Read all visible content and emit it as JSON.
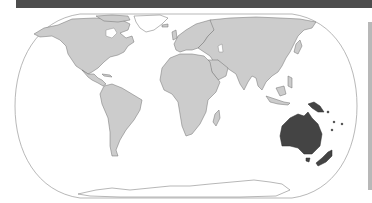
{
  "map": {
    "title": "",
    "projection": "equal-earth",
    "highlighted_region": "Oceania",
    "highlighted_countries": [
      "Australia",
      "Papua New Guinea",
      "New Zealand",
      "Solomon Islands",
      "Vanuatu",
      "Fiji",
      "New Caledonia"
    ],
    "colors": {
      "land": "#cccccc",
      "highlight": "#444444",
      "ocean": "#ffffff",
      "border": "#6e6e6e",
      "header_bar": "#4d4d4d"
    }
  }
}
